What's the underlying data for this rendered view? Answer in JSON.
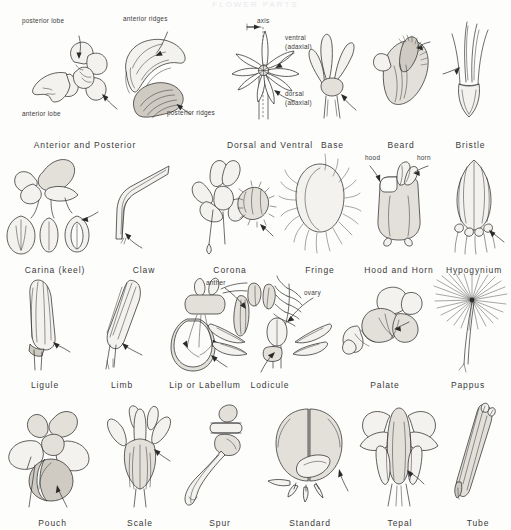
{
  "plate": {
    "title": "FLOWER PARTS",
    "caption_style": "botanical-glossary-plate"
  },
  "rows": [
    {
      "index": 1,
      "figures": [
        {
          "caption": "Anterior and Posterior",
          "name": "anterior-and-posterior",
          "annotations": [
            "posterior lobe",
            "anterior lobe"
          ]
        },
        {
          "caption": "",
          "name": "anterior-posterior-ridges",
          "annotations": [
            "anterior ridges",
            "posterior ridges"
          ]
        },
        {
          "caption": "Dorsal and Ventral",
          "name": "dorsal-and-ventral",
          "annotations": [
            "axis",
            "ventral",
            "(adaxial)",
            "dorsal",
            "(abaxial)"
          ]
        },
        {
          "caption": "Base",
          "name": "base",
          "annotations": []
        },
        {
          "caption": "Beard",
          "name": "beard",
          "annotations": []
        },
        {
          "caption": "Bristle",
          "name": "bristle",
          "annotations": []
        }
      ]
    },
    {
      "index": 2,
      "figures": [
        {
          "caption": "Carina (keel)",
          "name": "carina-keel",
          "annotations": []
        },
        {
          "caption": "Claw",
          "name": "claw",
          "annotations": []
        },
        {
          "caption": "Corona",
          "name": "corona",
          "annotations": []
        },
        {
          "caption": "Fringe",
          "name": "fringe",
          "annotations": []
        },
        {
          "caption": "Hood and Horn",
          "name": "hood-and-horn",
          "annotations": [
            "hood",
            "horn"
          ]
        },
        {
          "caption": "Hypogynium",
          "name": "hypogynium",
          "annotations": []
        }
      ]
    },
    {
      "index": 3,
      "figures": [
        {
          "caption": "Ligule",
          "name": "ligule",
          "annotations": []
        },
        {
          "caption": "Limb",
          "name": "limb",
          "annotations": []
        },
        {
          "caption": "Lip or Labellum",
          "name": "lip-or-labellum",
          "annotations": []
        },
        {
          "caption": "Lodicule",
          "name": "lodicule",
          "annotations": [
            "anther",
            "ovary"
          ]
        },
        {
          "caption": "Palate",
          "name": "palate",
          "annotations": []
        },
        {
          "caption": "Pappus",
          "name": "pappus",
          "annotations": []
        }
      ]
    },
    {
      "index": 4,
      "figures": [
        {
          "caption": "Pouch",
          "name": "pouch",
          "annotations": []
        },
        {
          "caption": "Scale",
          "name": "scale",
          "annotations": []
        },
        {
          "caption": "Spur",
          "name": "spur",
          "annotations": []
        },
        {
          "caption": "Standard",
          "name": "standard",
          "annotations": []
        },
        {
          "caption": "Tepal",
          "name": "tepal",
          "annotations": []
        },
        {
          "caption": "Tube",
          "name": "tube",
          "annotations": []
        }
      ]
    }
  ],
  "annotations": {
    "posterior_lobe": "posterior lobe",
    "anterior_lobe": "anterior lobe",
    "anterior_ridges": "anterior ridges",
    "posterior_ridges": "posterior ridges",
    "axis": "axis",
    "ventral": "ventral",
    "adaxial": "(adaxial)",
    "dorsal": "dorsal",
    "abaxial": "(abaxial)",
    "hood": "hood",
    "horn": "horn",
    "anther": "anther",
    "ovary": "ovary"
  },
  "colors": {
    "paper": "#fdfdfc",
    "ink": "#2e2e2e",
    "caption": "#3a3a3a",
    "shade_light": "#f4f2ee",
    "shade_mid": "#e3e0da",
    "shade_dark": "#cfcbc3"
  }
}
